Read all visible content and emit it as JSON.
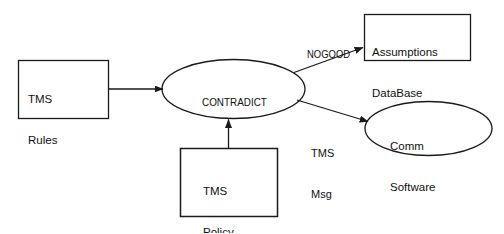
{
  "diagram": {
    "background_color": "#ffffff",
    "stroke_color": "#1a1a1a",
    "text_color": "#101010",
    "nodes": [
      {
        "id": "tms-rules",
        "shape": "rectangle",
        "lines": [
          "TMS",
          "Rules"
        ],
        "line1": "TMS",
        "line2": "Rules"
      },
      {
        "id": "contradict",
        "shape": "ellipse",
        "lines": [
          "CONTRADICT"
        ],
        "line1": "CONTRADICT"
      },
      {
        "id": "tms-policy",
        "shape": "rectangle",
        "lines": [
          "TMS",
          "Policy"
        ],
        "line1": "TMS",
        "line2": "Policy"
      },
      {
        "id": "assumptions-database",
        "shape": "rectangle",
        "lines": [
          "Assumptions",
          "DataBase"
        ],
        "line1": "Assumptions",
        "line2": "DataBase"
      },
      {
        "id": "comm-software",
        "shape": "ellipse",
        "lines": [
          "Comm",
          "Software"
        ],
        "line1": "Comm",
        "line2": "Software"
      }
    ],
    "edges": [
      {
        "id": "rules-to-contradict",
        "from": "tms-rules",
        "to": "contradict",
        "label": ""
      },
      {
        "id": "policy-to-contradict",
        "from": "tms-policy",
        "to": "contradict",
        "label": ""
      },
      {
        "id": "contradict-to-assumptions",
        "from": "contradict",
        "to": "assumptions-database",
        "label": "NOGOOD"
      },
      {
        "id": "contradict-to-comm",
        "from": "contradict",
        "to": "comm-software",
        "label_line1": "TMS",
        "label_line2": "Msg"
      }
    ]
  }
}
